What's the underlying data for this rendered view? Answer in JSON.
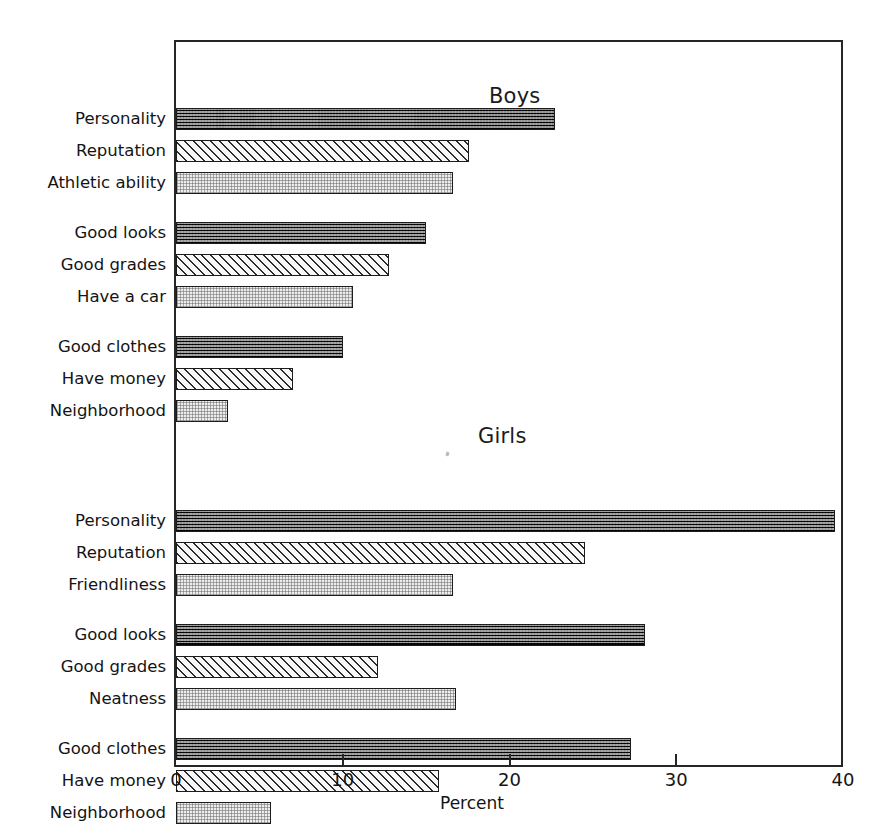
{
  "chart_data": {
    "type": "bar",
    "orientation": "horizontal",
    "title": "",
    "xlabel": "Percent",
    "ylabel": "",
    "xlim": [
      0,
      40
    ],
    "xticks": [
      0,
      10,
      20,
      30,
      40
    ],
    "xtick_labels": [
      "0",
      "10",
      "20",
      "30",
      "40"
    ],
    "grid": false,
    "legend": "none",
    "panels": [
      {
        "name": "Boys",
        "groups": [
          {
            "items": [
              {
                "label": "Personality",
                "value": 22.7,
                "pattern": "dark"
              },
              {
                "label": "Reputation",
                "value": 17.6,
                "pattern": "hatch"
              },
              {
                "label": "Athletic ability",
                "value": 16.6,
                "pattern": "dot"
              }
            ]
          },
          {
            "items": [
              {
                "label": "Good looks",
                "value": 15.0,
                "pattern": "dark"
              },
              {
                "label": "Good grades",
                "value": 12.8,
                "pattern": "hatch"
              },
              {
                "label": "Have a car",
                "value": 10.6,
                "pattern": "dot"
              }
            ]
          },
          {
            "items": [
              {
                "label": "Good clothes",
                "value": 10.0,
                "pattern": "dark"
              },
              {
                "label": "Have money",
                "value": 7.0,
                "pattern": "hatch"
              },
              {
                "label": "Neighborhood",
                "value": 3.1,
                "pattern": "dot"
              }
            ]
          }
        ]
      },
      {
        "name": "Girls",
        "groups": [
          {
            "items": [
              {
                "label": "Personality",
                "value": 39.5,
                "pattern": "dark"
              },
              {
                "label": "Reputation",
                "value": 24.5,
                "pattern": "hatch"
              },
              {
                "label": "Friendliness",
                "value": 16.6,
                "pattern": "dot"
              }
            ]
          },
          {
            "items": [
              {
                "label": "Good looks",
                "value": 28.1,
                "pattern": "dark"
              },
              {
                "label": "Good grades",
                "value": 12.1,
                "pattern": "hatch"
              },
              {
                "label": "Neatness",
                "value": 16.8,
                "pattern": "dot"
              }
            ]
          },
          {
            "items": [
              {
                "label": "Good clothes",
                "value": 27.3,
                "pattern": "dark"
              },
              {
                "label": "Have money",
                "value": 15.8,
                "pattern": "hatch"
              },
              {
                "label": "Neighborhood",
                "value": 5.7,
                "pattern": "dot"
              }
            ]
          }
        ]
      }
    ]
  },
  "panel_titles": {
    "boys": "Boys",
    "girls": "Girls"
  },
  "axis": {
    "title": "Percent",
    "tick_labels": [
      "0",
      "10",
      "20",
      "30",
      "40"
    ]
  },
  "colors": {
    "ink": "#1a1a1a",
    "frame": "#262626",
    "bar_dark": "#3a3a3a",
    "bar_hatch": "#f2f2f2",
    "bar_dot": "#ededed"
  }
}
